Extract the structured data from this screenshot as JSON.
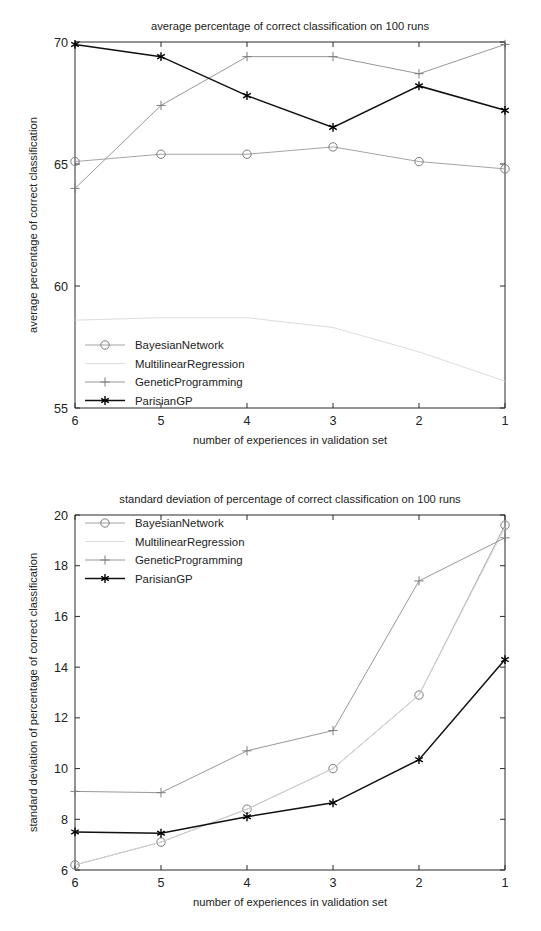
{
  "page": {
    "background": "#ffffff",
    "figure_count": 2
  },
  "colors": {
    "bayesian": "#9a9a9a",
    "multilinear": "#d8d8d8",
    "genetic": "#8c8c8c",
    "parisian": "#101010",
    "axis": "#2b2b2b",
    "text": "#222222"
  },
  "legend_markers": {
    "bayesian": "circle-marker",
    "multilinear": "dotted-line-marker",
    "genetic": "plus-marker",
    "parisian": "asterisk-marker"
  },
  "chart_data": [
    {
      "id": "average-chart",
      "type": "line",
      "title": "average percentage of correct classification on 100 runs",
      "xlabel": "number of experiences in validation set",
      "ylabel": "average percentage of correct classification",
      "categories": [
        "6",
        "5",
        "4",
        "3",
        "2",
        "1"
      ],
      "x": [
        6,
        5,
        4,
        3,
        2,
        1
      ],
      "xlim": [
        6,
        1
      ],
      "ylim": [
        55,
        70
      ],
      "xticks": [
        "6",
        "5",
        "4",
        "3",
        "2",
        "1"
      ],
      "yticks": [
        "55",
        "60",
        "65",
        "70"
      ],
      "grid": false,
      "legend_position": "lower-left",
      "series": [
        {
          "name": "BayesianNetwork",
          "marker": "circle",
          "values": [
            65.1,
            65.4,
            65.4,
            65.7,
            65.1,
            64.8
          ]
        },
        {
          "name": "MultilinearRegression",
          "marker": "none",
          "values": [
            58.6,
            58.7,
            58.7,
            58.3,
            57.3,
            56.1
          ]
        },
        {
          "name": "GeneticProgramming",
          "marker": "plus",
          "values": [
            64.0,
            67.4,
            69.4,
            69.4,
            68.7,
            69.9
          ]
        },
        {
          "name": "ParisianGP",
          "marker": "asterisk",
          "values": [
            69.9,
            69.4,
            67.8,
            66.5,
            68.2,
            67.2
          ]
        }
      ]
    },
    {
      "id": "stddev-chart",
      "type": "line",
      "title": "standard deviation of percentage of correct classification on 100 runs",
      "xlabel": "number of experiences in validation set",
      "ylabel": "standard deviation of percentage of correct classification",
      "categories": [
        "6",
        "5",
        "4",
        "3",
        "2",
        "1"
      ],
      "x": [
        6,
        5,
        4,
        3,
        2,
        1
      ],
      "xlim": [
        6,
        1
      ],
      "ylim": [
        6,
        20
      ],
      "xticks": [
        "6",
        "5",
        "4",
        "3",
        "2",
        "1"
      ],
      "yticks": [
        "6",
        "8",
        "10",
        "12",
        "14",
        "16",
        "18",
        "20"
      ],
      "grid": false,
      "legend_position": "upper-left",
      "series": [
        {
          "name": "BayesianNetwork",
          "marker": "circle",
          "values": [
            6.2,
            7.1,
            8.4,
            10.0,
            12.9,
            19.6
          ]
        },
        {
          "name": "MultilinearRegression",
          "marker": "none",
          "values": [
            6.2,
            7.1,
            8.4,
            10.0,
            12.9,
            19.5
          ]
        },
        {
          "name": "GeneticProgramming",
          "marker": "plus",
          "values": [
            9.1,
            9.05,
            10.7,
            11.5,
            17.4,
            19.1
          ]
        },
        {
          "name": "ParisianGP",
          "marker": "asterisk",
          "values": [
            7.5,
            7.45,
            8.1,
            8.65,
            10.35,
            14.3
          ]
        }
      ]
    }
  ]
}
